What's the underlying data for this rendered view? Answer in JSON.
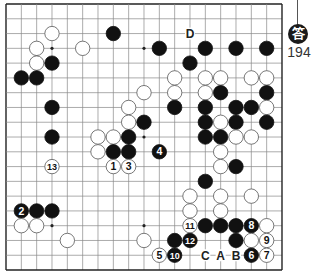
{
  "diagram": {
    "type": "go-board",
    "size": 19,
    "geometry": {
      "left": 6,
      "top": 4,
      "dx": 15.333,
      "dy": 14.78,
      "stone_r": 7.2
    },
    "colors": {
      "line": "#888888",
      "border": "#222222",
      "black": "#111111",
      "white": "#ffffff",
      "white_edge": "#555555",
      "label": "#222222"
    },
    "star_points": [
      [
        3,
        3
      ],
      [
        9,
        3
      ],
      [
        3,
        9
      ],
      [
        9,
        9
      ],
      [
        3,
        15
      ],
      [
        9,
        15
      ],
      [
        15,
        15
      ]
    ],
    "stones": [
      {
        "c": 7,
        "r": 2,
        "color": "black"
      },
      {
        "c": 3,
        "r": 2,
        "color": "white"
      },
      {
        "c": 2,
        "r": 3,
        "color": "white"
      },
      {
        "c": 5,
        "r": 3,
        "color": "white"
      },
      {
        "c": 10,
        "r": 3,
        "color": "black"
      },
      {
        "c": 13,
        "r": 3,
        "color": "black"
      },
      {
        "c": 15,
        "r": 3,
        "color": "black"
      },
      {
        "c": 17,
        "r": 3,
        "color": "black"
      },
      {
        "c": 2,
        "r": 4,
        "color": "white"
      },
      {
        "c": 3,
        "r": 4,
        "color": "black"
      },
      {
        "c": 12,
        "r": 4,
        "color": "black"
      },
      {
        "c": 1,
        "r": 5,
        "color": "black"
      },
      {
        "c": 2,
        "r": 5,
        "color": "black"
      },
      {
        "c": 11,
        "r": 5,
        "color": "white"
      },
      {
        "c": 13,
        "r": 5,
        "color": "white"
      },
      {
        "c": 14,
        "r": 5,
        "color": "white"
      },
      {
        "c": 16,
        "r": 5,
        "color": "white"
      },
      {
        "c": 17,
        "r": 5,
        "color": "white"
      },
      {
        "c": 9,
        "r": 6,
        "color": "white"
      },
      {
        "c": 11,
        "r": 6,
        "color": "white"
      },
      {
        "c": 13,
        "r": 6,
        "color": "white"
      },
      {
        "c": 14,
        "r": 6,
        "color": "black"
      },
      {
        "c": 17,
        "r": 6,
        "color": "black"
      },
      {
        "c": 3,
        "r": 7,
        "color": "black"
      },
      {
        "c": 8,
        "r": 7,
        "color": "white"
      },
      {
        "c": 11,
        "r": 7,
        "color": "black"
      },
      {
        "c": 13,
        "r": 7,
        "color": "black"
      },
      {
        "c": 15,
        "r": 7,
        "color": "black"
      },
      {
        "c": 16,
        "r": 7,
        "color": "black"
      },
      {
        "c": 17,
        "r": 7,
        "color": "white"
      },
      {
        "c": 8,
        "r": 8,
        "color": "white"
      },
      {
        "c": 9,
        "r": 8,
        "color": "black"
      },
      {
        "c": 13,
        "r": 8,
        "color": "black"
      },
      {
        "c": 14,
        "r": 8,
        "color": "white"
      },
      {
        "c": 15,
        "r": 8,
        "color": "black"
      },
      {
        "c": 17,
        "r": 8,
        "color": "black"
      },
      {
        "c": 3,
        "r": 9,
        "color": "black"
      },
      {
        "c": 6,
        "r": 9,
        "color": "white"
      },
      {
        "c": 7,
        "r": 9,
        "color": "white"
      },
      {
        "c": 8,
        "r": 9,
        "color": "black"
      },
      {
        "c": 13,
        "r": 9,
        "color": "black"
      },
      {
        "c": 14,
        "r": 9,
        "color": "black"
      },
      {
        "c": 15,
        "r": 9,
        "color": "white"
      },
      {
        "c": 16,
        "r": 9,
        "color": "white"
      },
      {
        "c": 6,
        "r": 10,
        "color": "white"
      },
      {
        "c": 7,
        "r": 10,
        "color": "black"
      },
      {
        "c": 8,
        "r": 10,
        "color": "black"
      },
      {
        "c": 10,
        "r": 10,
        "color": "black",
        "num": "4"
      },
      {
        "c": 14,
        "r": 10,
        "color": "white"
      },
      {
        "c": 3,
        "r": 11,
        "color": "white",
        "num": "13"
      },
      {
        "c": 7,
        "r": 11,
        "color": "white",
        "num": "1"
      },
      {
        "c": 8,
        "r": 11,
        "color": "white",
        "num": "3"
      },
      {
        "c": 14,
        "r": 11,
        "color": "white"
      },
      {
        "c": 15,
        "r": 11,
        "color": "black"
      },
      {
        "c": 13,
        "r": 12,
        "color": "black"
      },
      {
        "c": 12,
        "r": 13,
        "color": "white"
      },
      {
        "c": 14,
        "r": 13,
        "color": "white"
      },
      {
        "c": 16,
        "r": 13,
        "color": "white"
      },
      {
        "c": 1,
        "r": 14,
        "color": "black",
        "num": "2"
      },
      {
        "c": 2,
        "r": 14,
        "color": "black"
      },
      {
        "c": 3,
        "r": 14,
        "color": "black"
      },
      {
        "c": 12,
        "r": 14,
        "color": "white"
      },
      {
        "c": 14,
        "r": 14,
        "color": "white"
      },
      {
        "c": 1,
        "r": 15,
        "color": "white"
      },
      {
        "c": 2,
        "r": 15,
        "color": "white"
      },
      {
        "c": 12,
        "r": 15,
        "color": "white",
        "num": "11"
      },
      {
        "c": 13,
        "r": 15,
        "color": "black"
      },
      {
        "c": 14,
        "r": 15,
        "color": "black"
      },
      {
        "c": 15,
        "r": 15,
        "color": "black"
      },
      {
        "c": 16,
        "r": 15,
        "color": "black",
        "num": "8"
      },
      {
        "c": 17,
        "r": 15,
        "color": "white"
      },
      {
        "c": 4,
        "r": 16,
        "color": "white"
      },
      {
        "c": 9,
        "r": 16,
        "color": "white"
      },
      {
        "c": 11,
        "r": 16,
        "color": "black"
      },
      {
        "c": 12,
        "r": 16,
        "color": "black",
        "num": "12"
      },
      {
        "c": 15,
        "r": 16,
        "color": "black"
      },
      {
        "c": 16,
        "r": 16,
        "color": "white"
      },
      {
        "c": 17,
        "r": 16,
        "color": "white",
        "num": "9"
      },
      {
        "c": 10,
        "r": 17,
        "color": "white",
        "num": "5"
      },
      {
        "c": 11,
        "r": 17,
        "color": "black",
        "num": "10"
      },
      {
        "c": 16,
        "r": 17,
        "color": "black",
        "num": "6"
      },
      {
        "c": 17,
        "r": 17,
        "color": "white",
        "num": "7"
      }
    ],
    "labels": [
      {
        "c": 12,
        "r": 2,
        "text": "D"
      },
      {
        "c": 13,
        "r": 17,
        "text": "C"
      },
      {
        "c": 14,
        "r": 17,
        "text": "A"
      },
      {
        "c": 15,
        "r": 17,
        "text": "B"
      }
    ]
  },
  "badge": {
    "symbol": "答",
    "number": "194"
  }
}
